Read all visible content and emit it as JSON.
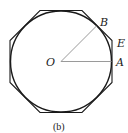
{
  "figure": {
    "caption": "(b)",
    "labels": {
      "O": "O",
      "A": "A",
      "B": "B",
      "E": "E"
    },
    "colors": {
      "outline": "#1a1a1a",
      "radius_lines": "#9a9a9a"
    },
    "geometry": {
      "center": [
        61,
        61.5
      ],
      "circle_radius": 50,
      "octagon_apothem": 51,
      "angle_AOB_degrees": 45
    }
  }
}
